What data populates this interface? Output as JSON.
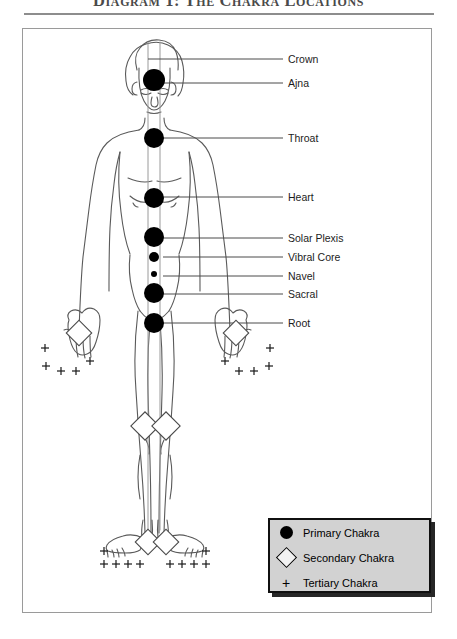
{
  "title": "Diagram 1:  The Chakra Locations",
  "labels": [
    {
      "name": "Crown",
      "text": "Crown",
      "x": 288,
      "y": 54,
      "line_y": 59,
      "line_x1": 148,
      "line_x2": 283
    },
    {
      "name": "Ajna",
      "text": "Ajna",
      "x": 288,
      "y": 78,
      "line_y": 83,
      "line_x1": 163,
      "line_x2": 283
    },
    {
      "name": "Throat",
      "text": "Throat",
      "x": 288,
      "y": 133,
      "line_y": 138,
      "line_x1": 163,
      "line_x2": 283
    },
    {
      "name": "Heart",
      "text": "Heart",
      "x": 288,
      "y": 192,
      "line_y": 197,
      "line_x1": 163,
      "line_x2": 283
    },
    {
      "name": "Solar Plexis",
      "text": "Solar Plexis",
      "x": 288,
      "y": 233,
      "line_y": 238,
      "line_x1": 163,
      "line_x2": 283
    },
    {
      "name": "Vibral Core",
      "text": "Vibral Core",
      "x": 288,
      "y": 252,
      "line_y": 257,
      "line_x1": 163,
      "line_x2": 283
    },
    {
      "name": "Navel",
      "text": "Navel",
      "x": 288,
      "y": 271,
      "line_y": 276,
      "line_x1": 163,
      "line_x2": 283
    },
    {
      "name": "Sacral",
      "text": "Sacral",
      "x": 288,
      "y": 290,
      "line_y": 294,
      "line_x1": 163,
      "line_x2": 283
    },
    {
      "name": "Root",
      "text": "Root",
      "x": 288,
      "y": 318,
      "line_y": 323,
      "line_x1": 163,
      "line_x2": 283
    }
  ],
  "legend": {
    "primary": {
      "label": "Primary Chakra",
      "marker": "filled-circle-icon"
    },
    "secondary": {
      "label": "Secondary Chakra",
      "marker": "diamond-icon"
    },
    "tertiary": {
      "label": "Tertiary Chakra",
      "marker": "plus-icon"
    }
  },
  "colors": {
    "primary_marker": "#000000",
    "secondary_marker_fill": "#f2f2f2",
    "secondary_marker_stroke": "#000000",
    "legend_background": "#d2d2d2",
    "legend_border": "#101010",
    "frame_border": "#9a9a9a",
    "body_outline": "#5a5a5a"
  },
  "chakras": {
    "primary": [
      {
        "name": "crown",
        "cx": 154,
        "cy": 46,
        "r": 0
      },
      {
        "name": "ajna",
        "cx": 154,
        "cy": 80,
        "r": 11
      },
      {
        "name": "throat",
        "cx": 154,
        "cy": 138,
        "r": 10
      },
      {
        "name": "heart",
        "cx": 154,
        "cy": 198,
        "r": 10
      },
      {
        "name": "solar-plexis",
        "cx": 154,
        "cy": 237,
        "r": 10
      },
      {
        "name": "vibral-core",
        "cx": 154,
        "cy": 257,
        "r": 5
      },
      {
        "name": "navel",
        "cx": 154,
        "cy": 274,
        "r": 3
      },
      {
        "name": "sacral",
        "cx": 154,
        "cy": 293,
        "r": 10
      },
      {
        "name": "root",
        "cx": 154,
        "cy": 323,
        "r": 10
      }
    ],
    "secondary": [
      {
        "name": "left-palm",
        "cx": 79,
        "cy": 333,
        "s": 11
      },
      {
        "name": "right-palm",
        "cx": 236,
        "cy": 333,
        "s": 11
      },
      {
        "name": "left-knee",
        "cx": 145,
        "cy": 426,
        "s": 13
      },
      {
        "name": "right-knee",
        "cx": 166,
        "cy": 426,
        "s": 13
      },
      {
        "name": "left-instep",
        "cx": 148,
        "cy": 542,
        "s": 12
      },
      {
        "name": "right-instep",
        "cx": 166,
        "cy": 542,
        "s": 12
      }
    ],
    "tertiary_count": 22
  }
}
